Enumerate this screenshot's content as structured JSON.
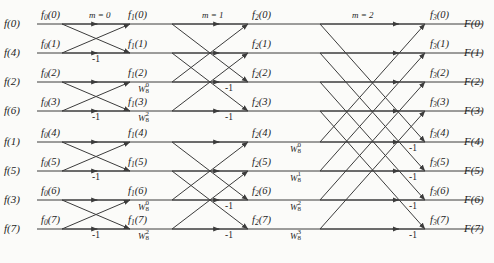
{
  "diagram": {
    "rows": 8,
    "stage_labels": [
      "m = 0",
      "m = 1",
      "m = 2"
    ],
    "minus_one": "-1",
    "line_color": "#3c3c3c",
    "text_color": "#1d1d1d",
    "background": "#fbfbf9"
  },
  "inputs": [
    {
      "label": "f(0)"
    },
    {
      "label": "f(4)"
    },
    {
      "label": "f(2)"
    },
    {
      "label": "f(6)"
    },
    {
      "label": "f(1)"
    },
    {
      "label": "f(5)"
    },
    {
      "label": "f(3)"
    },
    {
      "label": "f(7)"
    }
  ],
  "outputs": [
    {
      "label": "F(0)"
    },
    {
      "label": "F(1)"
    },
    {
      "label": "F(2)"
    },
    {
      "label": "F(3)"
    },
    {
      "label": "F(4)"
    },
    {
      "label": "F(5)"
    },
    {
      "label": "F(6)"
    },
    {
      "label": "F(7)"
    }
  ],
  "columns": [
    {
      "name": "f0",
      "base": "f",
      "sub": "0",
      "nodes": [
        "f0(0)",
        "f0(1)",
        "f0(2)",
        "f0(3)",
        "f0(4)",
        "f0(5)",
        "f0(6)",
        "f0(7)"
      ]
    },
    {
      "name": "f1",
      "base": "f",
      "sub": "1",
      "nodes": [
        "f1(0)",
        "f1(1)",
        "f1(2)",
        "f1(3)",
        "f1(4)",
        "f1(5)",
        "f1(6)",
        "f1(7)"
      ]
    },
    {
      "name": "f2",
      "base": "f",
      "sub": "2",
      "nodes": [
        "f2(0)",
        "f2(1)",
        "f2(2)",
        "f2(3)",
        "f2(4)",
        "f2(5)",
        "f2(6)",
        "f2(7)"
      ]
    },
    {
      "name": "f3",
      "base": "f",
      "sub": "3",
      "nodes": [
        "f3(0)",
        "f3(1)",
        "f3(2)",
        "f3(3)",
        "f3(4)",
        "f3(5)",
        "f3(6)",
        "f3(7)"
      ]
    }
  ],
  "node_text": {
    "c0": [
      "f0(0)",
      "f0(1)",
      "f0(2)",
      "f0(3)",
      "f0(4)",
      "f0(5)",
      "f0(6)",
      "f0(7)"
    ],
    "c1": [
      "f1(0)",
      "f1(1)",
      "f1(2)",
      "f1(3)",
      "f1(4)",
      "f1(5)",
      "f1(6)",
      "f1(7)"
    ],
    "c2": [
      "f2(0)",
      "f2(1)",
      "f2(2)",
      "f2(3)",
      "f2(4)",
      "f2(5)",
      "f2(6)",
      "f2(7)"
    ],
    "c3": [
      "f3(0)",
      "f3(1)",
      "f3(2)",
      "f3(3)",
      "f3(4)",
      "f3(5)",
      "f3(6)",
      "f3(7)"
    ]
  },
  "twiddles": {
    "stage0": [],
    "stage1": [
      {
        "row": 2,
        "base": "W",
        "sub": "8",
        "sup": "0"
      },
      {
        "row": 3,
        "base": "W",
        "sub": "8",
        "sup": "2"
      },
      {
        "row": 6,
        "base": "W",
        "sub": "8",
        "sup": "0"
      },
      {
        "row": 7,
        "base": "W",
        "sub": "8",
        "sup": "2"
      }
    ],
    "stage2": [
      {
        "row": 4,
        "base": "W",
        "sub": "8",
        "sup": "0"
      },
      {
        "row": 5,
        "base": "W",
        "sub": "8",
        "sup": "1"
      },
      {
        "row": 6,
        "base": "W",
        "sub": "8",
        "sup": "2"
      },
      {
        "row": 7,
        "base": "W",
        "sub": "8",
        "sup": "3"
      }
    ]
  },
  "minus_marks": {
    "stage0_rows": [
      1,
      3,
      5,
      7
    ],
    "stage1_rows": [
      2,
      3,
      6,
      7
    ],
    "stage2_rows": [
      4,
      5,
      6,
      7
    ]
  }
}
